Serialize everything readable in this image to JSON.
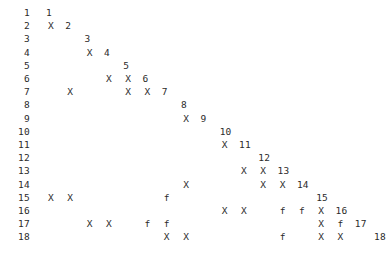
{
  "plot": {
    "kind": "matrix-pattern-plot",
    "background_color": "#ffffff",
    "text_color": "#2b2b2b",
    "n_rows": 18,
    "n_cols": 18,
    "row_label_x": 8,
    "first_col_x": 51,
    "col_step": 19.3,
    "first_row_y": 6,
    "row_step": 13.2,
    "marker_symbols": [
      "X",
      "f"
    ],
    "row_labels": [
      "1",
      "2",
      "3",
      "4",
      "5",
      "6",
      "7",
      "8",
      "9",
      "10",
      "11",
      "12",
      "13",
      "14",
      "15",
      "16",
      "17",
      "18"
    ],
    "rows": [
      {
        "label": "1",
        "diagonal_col": 1,
        "diagonal_text": "1",
        "cells": []
      },
      {
        "label": "2",
        "diagonal_col": 2,
        "diagonal_text": "2",
        "cells": [
          {
            "col": 1,
            "sym": "X"
          }
        ]
      },
      {
        "label": "3",
        "diagonal_col": 3,
        "diagonal_text": "3",
        "cells": []
      },
      {
        "label": "4",
        "diagonal_col": 4,
        "diagonal_text": "4",
        "cells": [
          {
            "col": 3,
            "sym": "X"
          }
        ]
      },
      {
        "label": "5",
        "diagonal_col": 5,
        "diagonal_text": "5",
        "cells": []
      },
      {
        "label": "6",
        "diagonal_col": 6,
        "diagonal_text": "6",
        "cells": [
          {
            "col": 4,
            "sym": "X"
          },
          {
            "col": 5,
            "sym": "X"
          }
        ]
      },
      {
        "label": "7",
        "diagonal_col": 7,
        "diagonal_text": "7",
        "cells": [
          {
            "col": 2,
            "sym": "X"
          },
          {
            "col": 5,
            "sym": "X"
          },
          {
            "col": 6,
            "sym": "X"
          }
        ]
      },
      {
        "label": "8",
        "diagonal_col": 8,
        "diagonal_text": "8",
        "cells": []
      },
      {
        "label": "9",
        "diagonal_col": 9,
        "diagonal_text": "9",
        "cells": [
          {
            "col": 8,
            "sym": "X"
          }
        ]
      },
      {
        "label": "10",
        "diagonal_col": 10,
        "diagonal_text": "10",
        "cells": []
      },
      {
        "label": "11",
        "diagonal_col": 11,
        "diagonal_text": "11",
        "cells": [
          {
            "col": 10,
            "sym": "X"
          }
        ]
      },
      {
        "label": "12",
        "diagonal_col": 12,
        "diagonal_text": "12",
        "cells": []
      },
      {
        "label": "13",
        "diagonal_col": 13,
        "diagonal_text": "13",
        "cells": [
          {
            "col": 11,
            "sym": "X"
          },
          {
            "col": 12,
            "sym": "X"
          }
        ]
      },
      {
        "label": "14",
        "diagonal_col": 14,
        "diagonal_text": "14",
        "cells": [
          {
            "col": 8,
            "sym": "X"
          },
          {
            "col": 12,
            "sym": "X"
          },
          {
            "col": 13,
            "sym": "X"
          }
        ]
      },
      {
        "label": "15",
        "diagonal_col": 15,
        "diagonal_text": "15",
        "cells": [
          {
            "col": 1,
            "sym": "X"
          },
          {
            "col": 2,
            "sym": "X"
          },
          {
            "col": 7,
            "sym": "f"
          }
        ]
      },
      {
        "label": "16",
        "diagonal_col": 16,
        "diagonal_text": "16",
        "cells": [
          {
            "col": 10,
            "sym": "X"
          },
          {
            "col": 11,
            "sym": "X"
          },
          {
            "col": 13,
            "sym": "f"
          },
          {
            "col": 14,
            "sym": "f"
          },
          {
            "col": 15,
            "sym": "X"
          }
        ]
      },
      {
        "label": "17",
        "diagonal_col": 17,
        "diagonal_text": "17",
        "cells": [
          {
            "col": 3,
            "sym": "X"
          },
          {
            "col": 4,
            "sym": "X"
          },
          {
            "col": 6,
            "sym": "f"
          },
          {
            "col": 7,
            "sym": "f"
          },
          {
            "col": 15,
            "sym": "X"
          },
          {
            "col": 16,
            "sym": "f"
          }
        ]
      },
      {
        "label": "18",
        "diagonal_col": 18,
        "diagonal_text": "18",
        "cells": [
          {
            "col": 7,
            "sym": "X"
          },
          {
            "col": 8,
            "sym": "X"
          },
          {
            "col": 13,
            "sym": "f"
          },
          {
            "col": 15,
            "sym": "X"
          },
          {
            "col": 16,
            "sym": "X"
          }
        ]
      }
    ]
  },
  "chart_data": {
    "type": "heatmap",
    "title": "",
    "xlabel": "",
    "ylabel": "",
    "grid": false,
    "legend": "none",
    "xlim": [
      1,
      18
    ],
    "ylim": [
      1,
      18
    ],
    "categories": [
      "1",
      "2",
      "3",
      "4",
      "5",
      "6",
      "7",
      "8",
      "9",
      "10",
      "11",
      "12",
      "13",
      "14",
      "15",
      "16",
      "17",
      "18"
    ],
    "tick_labels_y": [
      "1",
      "2",
      "3",
      "4",
      "5",
      "6",
      "7",
      "8",
      "9",
      "10",
      "11",
      "12",
      "13",
      "14",
      "15",
      "16",
      "17",
      "18"
    ],
    "annotations": [
      {
        "row": 1,
        "col": 1,
        "text": "1"
      },
      {
        "row": 2,
        "col": 1,
        "text": "X"
      },
      {
        "row": 2,
        "col": 2,
        "text": "2"
      },
      {
        "row": 3,
        "col": 3,
        "text": "3"
      },
      {
        "row": 4,
        "col": 3,
        "text": "X"
      },
      {
        "row": 4,
        "col": 4,
        "text": "4"
      },
      {
        "row": 5,
        "col": 5,
        "text": "5"
      },
      {
        "row": 6,
        "col": 4,
        "text": "X"
      },
      {
        "row": 6,
        "col": 5,
        "text": "X"
      },
      {
        "row": 6,
        "col": 6,
        "text": "6"
      },
      {
        "row": 7,
        "col": 2,
        "text": "X"
      },
      {
        "row": 7,
        "col": 5,
        "text": "X"
      },
      {
        "row": 7,
        "col": 6,
        "text": "X"
      },
      {
        "row": 7,
        "col": 7,
        "text": "7"
      },
      {
        "row": 8,
        "col": 8,
        "text": "8"
      },
      {
        "row": 9,
        "col": 8,
        "text": "X"
      },
      {
        "row": 9,
        "col": 9,
        "text": "9"
      },
      {
        "row": 10,
        "col": 10,
        "text": "10"
      },
      {
        "row": 11,
        "col": 10,
        "text": "X"
      },
      {
        "row": 11,
        "col": 11,
        "text": "11"
      },
      {
        "row": 12,
        "col": 12,
        "text": "12"
      },
      {
        "row": 13,
        "col": 11,
        "text": "X"
      },
      {
        "row": 13,
        "col": 12,
        "text": "X"
      },
      {
        "row": 13,
        "col": 13,
        "text": "13"
      },
      {
        "row": 14,
        "col": 8,
        "text": "X"
      },
      {
        "row": 14,
        "col": 12,
        "text": "X"
      },
      {
        "row": 14,
        "col": 13,
        "text": "X"
      },
      {
        "row": 14,
        "col": 14,
        "text": "14"
      },
      {
        "row": 15,
        "col": 1,
        "text": "X"
      },
      {
        "row": 15,
        "col": 2,
        "text": "X"
      },
      {
        "row": 15,
        "col": 7,
        "text": "f"
      },
      {
        "row": 15,
        "col": 15,
        "text": "15"
      },
      {
        "row": 16,
        "col": 10,
        "text": "X"
      },
      {
        "row": 16,
        "col": 11,
        "text": "X"
      },
      {
        "row": 16,
        "col": 13,
        "text": "f"
      },
      {
        "row": 16,
        "col": 14,
        "text": "f"
      },
      {
        "row": 16,
        "col": 15,
        "text": "X"
      },
      {
        "row": 16,
        "col": 16,
        "text": "16"
      },
      {
        "row": 17,
        "col": 3,
        "text": "X"
      },
      {
        "row": 17,
        "col": 4,
        "text": "X"
      },
      {
        "row": 17,
        "col": 6,
        "text": "f"
      },
      {
        "row": 17,
        "col": 7,
        "text": "f"
      },
      {
        "row": 17,
        "col": 15,
        "text": "X"
      },
      {
        "row": 17,
        "col": 16,
        "text": "f"
      },
      {
        "row": 17,
        "col": 17,
        "text": "17"
      },
      {
        "row": 18,
        "col": 7,
        "text": "X"
      },
      {
        "row": 18,
        "col": 8,
        "text": "X"
      },
      {
        "row": 18,
        "col": 13,
        "text": "f"
      },
      {
        "row": 18,
        "col": 15,
        "text": "X"
      },
      {
        "row": 18,
        "col": 16,
        "text": "X"
      },
      {
        "row": 18,
        "col": 18,
        "text": "18"
      }
    ]
  }
}
